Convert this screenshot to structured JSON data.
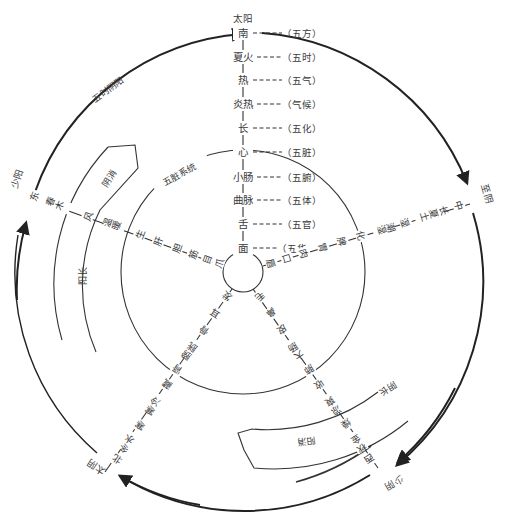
{
  "center_axis": {
    "top_label": "太阳",
    "items": [
      {
        "term": "南",
        "category": "（五方）"
      },
      {
        "term": "夏火",
        "category": "（五时）"
      },
      {
        "term": "热",
        "category": "（五气）"
      },
      {
        "term": "炎热",
        "category": "（气候）"
      },
      {
        "term": "长",
        "category": "（五化）"
      },
      {
        "term": "心",
        "category": "（五脏）"
      },
      {
        "term": "小肠",
        "category": "（五腑）"
      },
      {
        "term": "曲脉",
        "category": "（五体）"
      },
      {
        "term": "舌",
        "category": "（五官）"
      },
      {
        "term": "面",
        "category": "（五华"
      }
    ]
  },
  "circle_labels": {
    "outer_arc": "五时阴阳",
    "inner_circle": "五脏系统",
    "yin_decline": "阴消",
    "yang_growth": "阳长",
    "yang_decline": "阳消",
    "yin_growth": "阴长"
  },
  "spokes": {
    "east": {
      "phase": "少阳",
      "items": [
        "东",
        "春木",
        "风",
        "温暖",
        "生",
        "肝",
        "胆",
        "筋",
        "目",
        "爪"
      ]
    },
    "center": {
      "phase": "至阴",
      "items": [
        "中",
        "长夏土",
        "湿",
        "潮湿",
        "化",
        "脾",
        "胃",
        "肉",
        "口",
        "唇"
      ]
    },
    "west": {
      "phase": "少阴",
      "items": [
        "西",
        "秋金",
        "燥",
        "凉爽",
        "收",
        "肺",
        "大肠",
        "皮",
        "鼻",
        "毛"
      ]
    },
    "north": {
      "phase": "太阴",
      "items": [
        "北",
        "冬水",
        "寒",
        "寒冷",
        "藏",
        "肾",
        "膀胱",
        "骨",
        "耳",
        "发"
      ]
    }
  },
  "colors": {
    "line": "#333333",
    "arrow": "#222222",
    "text": "#3a3a3a",
    "background": "#ffffff"
  }
}
